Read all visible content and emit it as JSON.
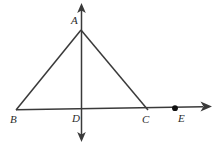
{
  "figure": {
    "background_color": "#ffffff",
    "stroke_color": "#3a3a3a",
    "label_color": "#2b2b2b",
    "width": 219,
    "height": 152
  },
  "points": [
    {
      "id": "A",
      "label": "A",
      "x": 81,
      "y": 30,
      "label_x": 71,
      "label_y": 15,
      "marked_dot": false
    },
    {
      "id": "B",
      "label": "B",
      "x": 16,
      "y": 110,
      "label_x": 10,
      "label_y": 114,
      "marked_dot": false
    },
    {
      "id": "C",
      "label": "C",
      "x": 148,
      "y": 110,
      "label_x": 142,
      "label_y": 114,
      "marked_dot": false
    },
    {
      "id": "D",
      "label": "D",
      "x": 81,
      "y": 110,
      "label_x": 72,
      "label_y": 113,
      "marked_dot": false
    },
    {
      "id": "E",
      "label": "E",
      "x": 175,
      "y": 108.5,
      "label_x": 178,
      "label_y": 113,
      "marked_dot": true
    }
  ],
  "segments": [
    {
      "id": "AB",
      "from": "B",
      "to": "A",
      "x1": 16,
      "y1": 110,
      "x2": 81,
      "y2": 30
    },
    {
      "id": "AC",
      "from": "A",
      "to": "C",
      "x1": 81,
      "y1": 30,
      "x2": 148,
      "y2": 110
    },
    {
      "id": "AD",
      "from": "A",
      "to": "D",
      "x1": 81,
      "y1": 30,
      "x2": 81,
      "y2": 110
    }
  ],
  "axes": {
    "horizontal": {
      "id": "horizontal-ray",
      "x1": 16,
      "y1": 109.5,
      "x2": 211,
      "y2": 106.5,
      "arrow_end": "right"
    },
    "vertical": {
      "id": "vertical-line",
      "x1": 81.5,
      "y1": 4,
      "x2": 81.5,
      "y2": 141,
      "arrow_start": "up",
      "arrow_end": "down"
    }
  },
  "dot_radius": 2.8,
  "stroke_width": 1.4
}
